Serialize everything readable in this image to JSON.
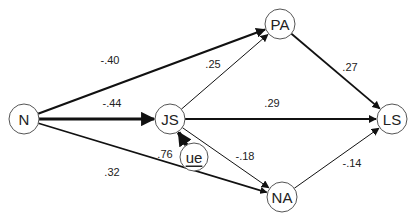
{
  "diagram": {
    "type": "path-diagram",
    "nodes": [
      {
        "id": "N",
        "label": "N",
        "x": 24,
        "y": 119,
        "r": 15
      },
      {
        "id": "JS",
        "label": "JS",
        "x": 170,
        "y": 119,
        "r": 15
      },
      {
        "id": "PA",
        "label": "PA",
        "x": 280,
        "y": 24,
        "r": 15
      },
      {
        "id": "LS",
        "label": "LS",
        "x": 392,
        "y": 119,
        "r": 15
      },
      {
        "id": "NA",
        "label": "NA",
        "x": 282,
        "y": 197,
        "r": 15
      },
      {
        "id": "ue",
        "label": "ue",
        "x": 194,
        "y": 157,
        "r": 14,
        "underline": true
      }
    ],
    "edges": [
      {
        "from": "N",
        "to": "PA",
        "label": "-.40",
        "weight": 2.2,
        "lx": 110,
        "ly": 60
      },
      {
        "from": "N",
        "to": "JS",
        "label": "-.44",
        "weight": 3.2,
        "lx": 112,
        "ly": 103
      },
      {
        "from": "N",
        "to": "NA",
        "label": ".32",
        "weight": 1.6,
        "lx": 112,
        "ly": 172
      },
      {
        "from": "JS",
        "to": "PA",
        "label": ".25",
        "weight": 1.0,
        "lx": 213,
        "ly": 64
      },
      {
        "from": "JS",
        "to": "LS",
        "label": ".29",
        "weight": 1.8,
        "lx": 272,
        "ly": 103
      },
      {
        "from": "JS",
        "to": "NA",
        "label": "-.18",
        "weight": 1.0,
        "lx": 245,
        "ly": 156
      },
      {
        "from": "PA",
        "to": "LS",
        "label": ".27",
        "weight": 1.8,
        "lx": 350,
        "ly": 67
      },
      {
        "from": "NA",
        "to": "LS",
        "label": "-.14",
        "weight": 1.0,
        "lx": 352,
        "ly": 163
      },
      {
        "from": "ue",
        "to": "JS",
        "label": ".76",
        "weight": 4.0,
        "lx": 165,
        "ly": 154
      }
    ]
  }
}
